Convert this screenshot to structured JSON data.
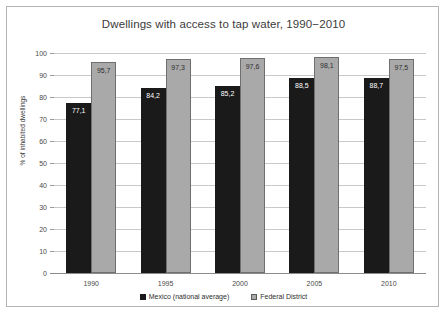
{
  "chart_data": {
    "type": "bar",
    "title": "Dwellings with access to tap water, 1990−2010",
    "xlabel": "",
    "ylabel": "% of inhabited dwellings",
    "ylim": [
      0,
      100
    ],
    "ytick_step": 10,
    "ytick_labels": [
      "100",
      "90",
      "80",
      "70",
      "60",
      "50",
      "40",
      "30",
      "20",
      "10",
      "0"
    ],
    "ytick_values": [
      100,
      90,
      80,
      70,
      60,
      50,
      40,
      30,
      20,
      10,
      0
    ],
    "grid": true,
    "legend_position": "bottom-center",
    "decimal_separator": ",",
    "categories": [
      "1990",
      "1995",
      "2000",
      "2005",
      "2010"
    ],
    "series": [
      {
        "name": "Mexico (national average)",
        "color": "#1a1a1a",
        "values": [
          77.1,
          84.2,
          85.2,
          88.5,
          88.7
        ],
        "labels": [
          "77,1",
          "84,2",
          "85,2",
          "88,5",
          "88,7"
        ]
      },
      {
        "name": "Federal District",
        "color": "#a9a9a9",
        "values": [
          95.7,
          97.3,
          97.6,
          98.1,
          97.5
        ],
        "labels": [
          "95,7",
          "97,3",
          "97,6",
          "98,1",
          "97,5"
        ]
      }
    ]
  }
}
